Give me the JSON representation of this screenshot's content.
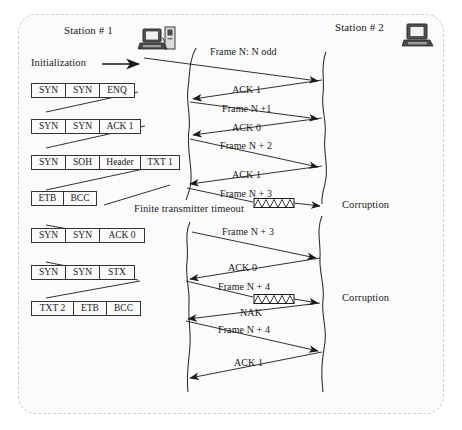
{
  "diagram": {
    "title_hidden": "",
    "type": "protocol-timing-sequence",
    "stations": [
      {
        "id": "station1",
        "label": "Station # 1",
        "icon": "computer-with-printer-icon"
      },
      {
        "id": "station2",
        "label": "Station # 2",
        "icon": "computer-icon"
      }
    ],
    "init_label": "Initialization",
    "timeout_label": "Finite transmitter timeout",
    "corruption_labels": [
      {
        "id": "corruption-1",
        "label": "Corruption"
      },
      {
        "id": "corruption-2",
        "label": "Corruption"
      }
    ],
    "pdus": [
      {
        "id": "pdu-1",
        "cells": [
          "SYN",
          "SYN",
          "ENQ"
        ],
        "widths": [
          34,
          34,
          34
        ]
      },
      {
        "id": "pdu-2",
        "cells": [
          "SYN",
          "SYN",
          "ACK 1"
        ],
        "widths": [
          34,
          34,
          40
        ]
      },
      {
        "id": "pdu-3",
        "cells": [
          "SYN",
          "SOH",
          "Header",
          "TXT 1"
        ],
        "widths": [
          34,
          34,
          41,
          38
        ]
      },
      {
        "id": "pdu-4",
        "cells": [
          "ETB",
          "BCC"
        ],
        "widths": [
          32,
          32
        ]
      },
      {
        "id": "pdu-5",
        "cells": [
          "SYN",
          "SYN",
          "ACK  0"
        ],
        "widths": [
          34,
          34,
          44
        ]
      },
      {
        "id": "pdu-6",
        "cells": [
          "SYN",
          "SYN",
          "STX"
        ],
        "widths": [
          34,
          34,
          34
        ]
      },
      {
        "id": "pdu-7",
        "cells": [
          "TXT 2",
          "ETB",
          "BCC"
        ],
        "widths": [
          42,
          33,
          33
        ]
      }
    ],
    "messages": [
      {
        "id": "msg-1",
        "label": "Frame N:  N  odd",
        "direction": "right"
      },
      {
        "id": "msg-2",
        "label": "ACK 1",
        "direction": "left"
      },
      {
        "id": "msg-3",
        "label": "Frame N +1",
        "direction": "right"
      },
      {
        "id": "msg-4",
        "label": "ACK 0",
        "direction": "left"
      },
      {
        "id": "msg-5",
        "label": "Frame N + 2",
        "direction": "right"
      },
      {
        "id": "msg-6",
        "label": "ACK 1",
        "direction": "left"
      },
      {
        "id": "msg-7",
        "label": "Frame N + 3",
        "direction": "right"
      },
      {
        "id": "msg-8",
        "label": "Frame N + 3",
        "direction": "right"
      },
      {
        "id": "msg-9",
        "label": "ACK 0",
        "direction": "left"
      },
      {
        "id": "msg-10",
        "label": "Frame N + 4",
        "direction": "right"
      },
      {
        "id": "msg-11",
        "label": "NAK",
        "direction": "left"
      },
      {
        "id": "msg-12",
        "label": "Frame N + 4",
        "direction": "right"
      },
      {
        "id": "msg-13",
        "label": "ACK 1",
        "direction": "left"
      }
    ]
  },
  "colors": {
    "ink": "#1a1a1a",
    "line": "#2a2a2a",
    "frame_border": "#cfcfcf",
    "page_background": "#ffffff",
    "panel_background": "#fbfbfb"
  }
}
